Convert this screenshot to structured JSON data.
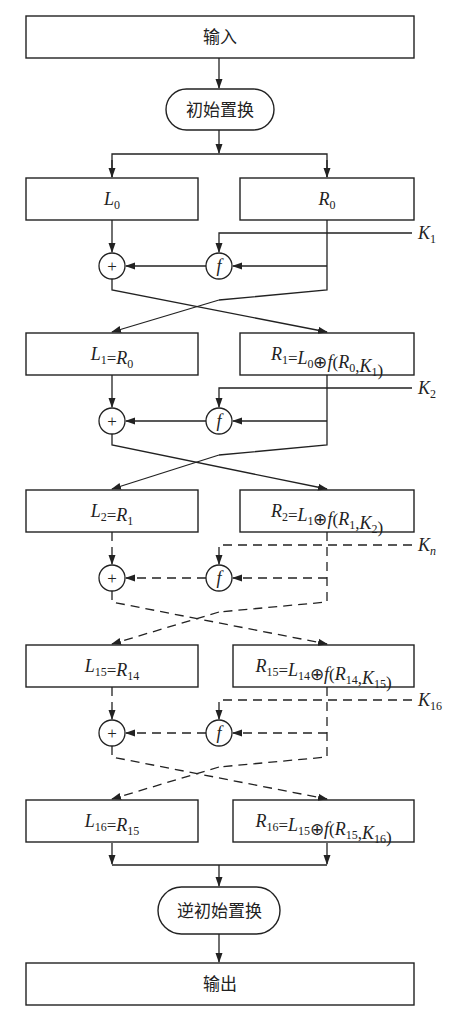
{
  "diagram": {
    "input_label": "输入",
    "initial_permutation_label": "初始置换",
    "inverse_permutation_label": "逆初始置换",
    "output_label": "输出",
    "xor_symbol": "+",
    "f_symbol": "f",
    "rows": [
      {
        "left": [
          [
            "L",
            "0"
          ]
        ],
        "right": [
          [
            "R",
            "0"
          ]
        ],
        "style": "solid"
      },
      {
        "left": [
          [
            "L",
            "1"
          ],
          [
            "=",
            ""
          ],
          [
            "R",
            "0"
          ]
        ],
        "right": [
          [
            "R",
            "1"
          ],
          [
            "=",
            ""
          ],
          [
            "L",
            "0"
          ],
          [
            "⊕",
            ""
          ],
          [
            "f",
            ""
          ],
          [
            "(",
            ""
          ],
          [
            "R",
            "0"
          ],
          [
            ",",
            ""
          ],
          [
            "K",
            "1"
          ],
          [
            ")",
            ""
          ]
        ],
        "style": "solid"
      },
      {
        "left": [
          [
            "L",
            "2"
          ],
          [
            "=",
            ""
          ],
          [
            "R",
            "1"
          ]
        ],
        "right": [
          [
            "R",
            "2"
          ],
          [
            "=",
            ""
          ],
          [
            "L",
            "1"
          ],
          [
            "⊕",
            ""
          ],
          [
            "f",
            ""
          ],
          [
            "(",
            ""
          ],
          [
            "R",
            "1"
          ],
          [
            ",",
            ""
          ],
          [
            "K",
            "2"
          ],
          [
            ")",
            ""
          ]
        ],
        "style": "dashed"
      },
      {
        "left": [
          [
            "L",
            "15"
          ],
          [
            "=",
            ""
          ],
          [
            "R",
            "14"
          ]
        ],
        "right": [
          [
            "R",
            "15"
          ],
          [
            "=",
            ""
          ],
          [
            "L",
            "14"
          ],
          [
            "⊕",
            ""
          ],
          [
            "f",
            ""
          ],
          [
            "(",
            ""
          ],
          [
            "R",
            "14"
          ],
          [
            ",",
            ""
          ],
          [
            "K",
            "15"
          ],
          [
            ")",
            ""
          ]
        ],
        "style": "dashed"
      },
      {
        "left": [
          [
            "L",
            "16"
          ],
          [
            "=",
            ""
          ],
          [
            "R",
            "15"
          ]
        ],
        "right": [
          [
            "R",
            "16"
          ],
          [
            "=",
            ""
          ],
          [
            "L",
            "15"
          ],
          [
            "⊕",
            ""
          ],
          [
            "f",
            ""
          ],
          [
            "(",
            ""
          ],
          [
            "R",
            "15"
          ],
          [
            ",",
            ""
          ],
          [
            "K",
            "16"
          ],
          [
            ")",
            ""
          ]
        ],
        "style": null
      }
    ],
    "keys": [
      {
        "name": "K",
        "sub": "1",
        "style": "solid"
      },
      {
        "name": "K",
        "sub": "2",
        "style": "solid"
      },
      {
        "name": "K",
        "sub": "n",
        "style": "dashed"
      },
      {
        "name": "K",
        "sub": "16",
        "style": "dashed"
      }
    ],
    "colors": {
      "stroke": "#222222",
      "background": "#ffffff"
    }
  }
}
